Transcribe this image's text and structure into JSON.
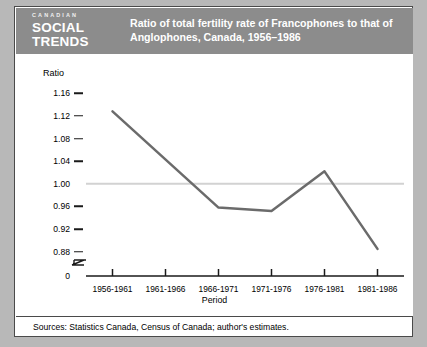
{
  "header": {
    "logo_eyebrow": "CANADIAN",
    "logo_line1": "SOCIAL",
    "logo_line2": "TRENDS",
    "title_line1": "Ratio of total fertility rate of Francophones to that of",
    "title_line2": "Anglophones, Canada, 1956–1986",
    "banner_color": "#8c8c8c",
    "title_color": "#ffffff"
  },
  "footer": {
    "sources": "Sources: Statistics Canada, Census of Canada; author's estimates."
  },
  "chart_data": {
    "type": "line",
    "title": "Ratio of total fertility rate of Francophones to that of Anglophones, Canada, 1956–1986",
    "xlabel": "Period",
    "ylabel": "Ratio",
    "categories": [
      "1956-1961",
      "1961-1966",
      "1966-1971",
      "1971-1976",
      "1976-1981",
      "1981-1986"
    ],
    "series": [
      {
        "name": "Francophone/Anglophone total fertility rate ratio",
        "values": [
          1.128,
          null,
          0.958,
          0.952,
          1.022,
          0.885
        ]
      }
    ],
    "values": [
      1.128,
      null,
      0.958,
      0.952,
      1.022,
      0.885
    ],
    "ylim": [
      0.86,
      1.18
    ],
    "ytick_labels": [
      "1.16",
      "1.12",
      "1.08",
      "1.04",
      "1.00",
      "0.96",
      "0.92",
      "0.88"
    ],
    "ytick_values": [
      1.16,
      1.12,
      1.08,
      1.04,
      1.0,
      0.96,
      0.92,
      0.88
    ],
    "axis_break": true,
    "axis_origin_label": "0",
    "reference_line": {
      "value": 1.0,
      "color": "#d2d2d2"
    },
    "grid": false,
    "legend": "none",
    "line_color": "#6b6b6b",
    "line_width": 2.5
  }
}
